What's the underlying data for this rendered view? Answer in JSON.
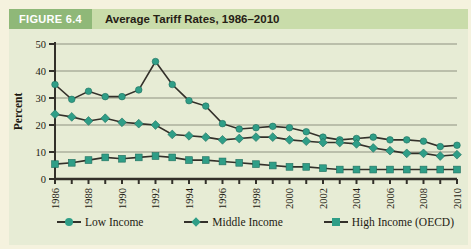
{
  "figure": {
    "label": "FIGURE 6.4",
    "title": "Average Tariff Rates, 1986–2010"
  },
  "theme": {
    "header_box": "#8fb878",
    "header_band": "#c9dcaa",
    "panel_bg": "#e7ecd5",
    "page_bg": "#f5f2de",
    "grid": "#8e9180",
    "axis": "#33302a",
    "line": "#33302a",
    "marker": "#2f9e87",
    "marker_edge": "#1f6e5e",
    "tick_text": "#1d1a12"
  },
  "chart_data": {
    "type": "line",
    "title": "Average Tariff Rates, 1986–2010",
    "xlabel": "",
    "ylabel": "Percent",
    "ylim": [
      0,
      50
    ],
    "yticks": [
      0,
      10,
      20,
      30,
      40,
      50
    ],
    "grid": true,
    "legend_position": "bottom",
    "x": [
      1986,
      1987,
      1988,
      1989,
      1990,
      1991,
      1992,
      1993,
      1994,
      1995,
      1996,
      1997,
      1998,
      1999,
      2000,
      2001,
      2002,
      2003,
      2004,
      2005,
      2006,
      2007,
      2008,
      2009,
      2010
    ],
    "xtick_labels": [
      "1986",
      "1988",
      "1990",
      "1992",
      "1994",
      "1996",
      "1998",
      "2000",
      "2002",
      "2004",
      "2006",
      "2008",
      "2010"
    ],
    "series": [
      {
        "name": "Low Income",
        "marker": "circle",
        "values": [
          35,
          29.5,
          32.5,
          30.5,
          30.5,
          33,
          43.5,
          35,
          29,
          27,
          20.5,
          18.5,
          19,
          19.5,
          19,
          17.5,
          15.5,
          14.5,
          15,
          15.5,
          14.5,
          14.5,
          14,
          12,
          12.5
        ]
      },
      {
        "name": "Middle Income",
        "marker": "diamond",
        "values": [
          24,
          23,
          21.5,
          22.5,
          21,
          20.5,
          20,
          16.5,
          16,
          15.5,
          14.5,
          15,
          15.5,
          15.5,
          14.5,
          14,
          13.5,
          13.5,
          13,
          11.5,
          10.5,
          9.5,
          9.5,
          8.5,
          9
        ]
      },
      {
        "name": "High Income (OECD)",
        "marker": "square",
        "values": [
          5.5,
          6,
          7,
          8,
          7.5,
          8,
          8.5,
          8,
          7,
          7,
          6.5,
          6,
          5.5,
          5,
          4.5,
          4.5,
          4,
          3.5,
          3.5,
          3.5,
          3.5,
          3.5,
          3.5,
          3.5,
          3.5
        ]
      }
    ]
  }
}
